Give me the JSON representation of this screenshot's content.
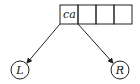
{
  "diagram": {
    "type": "trie-node-pointers",
    "array": {
      "cells": [
        {
          "label": "ca"
        },
        {
          "label": ""
        },
        {
          "label": ""
        },
        {
          "label": ""
        }
      ]
    },
    "children": [
      {
        "label": "L",
        "side": "left"
      },
      {
        "label": "R",
        "side": "right"
      }
    ],
    "colors": {
      "stroke": "#222222",
      "background": "#ffffff"
    }
  }
}
